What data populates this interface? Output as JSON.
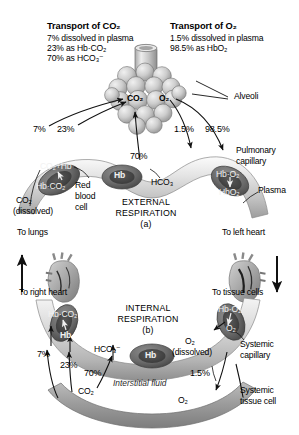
{
  "figure": {
    "title_co2": "Transport of CO₂",
    "title_o2": "Transport of O₂",
    "co2_lines": [
      "7% dissolved in plasma",
      "23% as Hb·CO₂",
      "70% as HCO₃⁻"
    ],
    "o2_lines": [
      "1.5% dissolved in plasma",
      "98.5% as HbO₂"
    ]
  },
  "upper": {
    "alveoli_label": "Alveoli",
    "gas_co2": "CO₂",
    "gas_o2": "O₂",
    "pct_7": "7%",
    "pct_23": "23%",
    "pct_70": "70%",
    "pct_15": "1.5%",
    "pct_985": "98.5%",
    "rbc_left_top": "CO₂+Hb",
    "rbc_left_bottom": "Hb·CO₂",
    "co2_dissolved": "CO₂",
    "co2_dissolved_2": "(dissolved)",
    "hb_center": "Hb",
    "hco3": "HCO₃",
    "rbc_right_top": "Hb·O₂",
    "rbc_right_bottom": "HbO₂",
    "rbc_name_1": "Red",
    "rbc_name_2": "blood",
    "rbc_name_3": "cell",
    "pulmonary_1": "Pulmonary",
    "pulmonary_2": "capillary",
    "plasma": "Plasma",
    "respiration_1": "EXTERNAL",
    "respiration_2": "RESPIRATION",
    "respiration_3": "(a)",
    "to_lungs": "To lungs",
    "to_left_heart": "To left heart"
  },
  "lower": {
    "to_right_heart": "To right heart",
    "to_tissue_cells": "To tissue cells",
    "respiration_1": "INTERNAL",
    "respiration_2": "RESPIRATION",
    "respiration_3": "(b)",
    "rbc_left_top": "Hb·CO₂",
    "rbc_left_bottom": "Hb",
    "pct_7": "7%",
    "pct_23": "23%",
    "pct_70": "70%",
    "pct_15": "1.5%",
    "hco3": "HCO₃⁻",
    "hb_center": "Hb",
    "rbc_right_top": "Hb·O₂",
    "rbc_right_bottom": "O₂",
    "o2_dissolved": "O₂",
    "o2_dissolved_2": "(dissolved)",
    "systemic_cap_1": "Systemic",
    "systemic_cap_2": "capillary",
    "interstitial": "Interstitial fluid",
    "tissue_co2": "CO₂",
    "tissue_o2": "O₂",
    "systemic_tissue_1": "Systemic",
    "systemic_tissue_2": "tissue cell"
  },
  "colors": {
    "vessel_light": "#d8d8d8",
    "vessel_mid": "#b8b8b8",
    "rbc_dark": "#6f6f6f",
    "rbc_core": "#4e4e4e",
    "alveoli": "#c9c9c9",
    "tissue": "#9a9a9a",
    "stroke": "#1a1a1a"
  }
}
